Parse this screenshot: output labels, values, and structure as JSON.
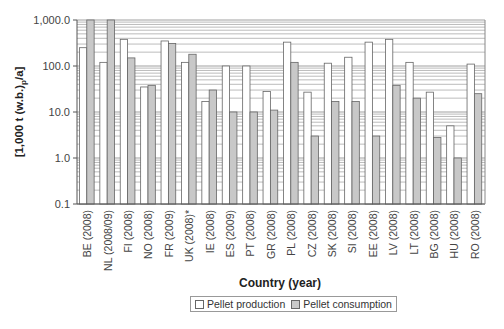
{
  "chart_data": {
    "type": "bar",
    "title": "",
    "xlabel": "Country (year)",
    "ylabel": "[1,000 t (w.b.)p/a]",
    "ylabel_main": "[1,000 t (w.b.)",
    "ylabel_sub": "p",
    "ylabel_tail": "/a]",
    "yscale": "log",
    "ylim": [
      0.1,
      1000
    ],
    "yticks": [
      "0.1",
      "1.0",
      "10.0",
      "100.0",
      "1,000.0"
    ],
    "grid": true,
    "legend_position": "bottom",
    "categories": [
      "BE (2008)",
      "NL (2008/09)",
      "FI (2008)",
      "NO (2008)",
      "FR (2009)",
      "UK (2008)*",
      "IE (2008)",
      "ES (2009)",
      "PT (2008)",
      "GR (2008)",
      "PL (2008)",
      "CZ (2008)",
      "SK (2008)",
      "SI (2008)",
      "EE (2008)",
      "LV (2008)",
      "LT (2008)",
      "BG (2008)",
      "HU (2008)",
      "RO (2008)"
    ],
    "series": [
      {
        "name": "Pellet production",
        "color": "#ffffff",
        "values": [
          250,
          120,
          380,
          35,
          350,
          120,
          17,
          100,
          100,
          28,
          330,
          27,
          115,
          155,
          330,
          380,
          120,
          27,
          5,
          110
        ]
      },
      {
        "name": "Pellet consumption",
        "color": "#c8c8c8",
        "values": [
          1000,
          1000,
          150,
          38,
          310,
          180,
          30,
          10,
          10,
          11,
          120,
          3,
          17,
          17,
          3,
          38,
          20,
          2.8,
          1,
          25
        ]
      }
    ]
  },
  "legend": {
    "production_label": "Pellet production",
    "consumption_label": "Pellet consumption"
  }
}
